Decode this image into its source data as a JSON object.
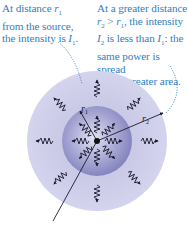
{
  "captions": {
    "left": {
      "line1_pre": "At distance ",
      "line1_var": "r",
      "line1_sub": "1",
      "line2": "from the source,",
      "line3_pre": "the intensity is ",
      "line3_var": "I",
      "line3_sub": "1",
      "line3_post": "."
    },
    "right": {
      "line1": "At a greater distance",
      "line2_var1": "r",
      "line2_sub1": "2",
      "line2_mid": " > ",
      "line2_var2": "r",
      "line2_sub2": "1",
      "line2_post": ", the intensity",
      "line3_var1": "I",
      "line3_sub1": "2",
      "line3_mid": " is less than ",
      "line3_var2": "I",
      "line3_sub2": "1",
      "line3_post": ": the",
      "line4": "same power is spread",
      "line5": "over a greater area."
    }
  },
  "diagram": {
    "labels": {
      "r1_var": "r",
      "r1_sub": "1",
      "r2_var": "r",
      "r2_sub": "2"
    },
    "colors": {
      "caption_text": "#2f7fbf",
      "outer_sphere": "#c9c9e6",
      "inner_sphere_center": "#dcdcef",
      "inner_sphere_edge": "#8c8cc4",
      "lines": "#1a1a2e",
      "leader_dots": "#2f7fbf"
    }
  }
}
